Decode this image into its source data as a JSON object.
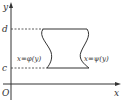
{
  "diagram": {
    "axes": {
      "x_label": "x",
      "y_label": "y",
      "origin_label": "O"
    },
    "levels": {
      "top_label": "d",
      "bottom_label": "c"
    },
    "curves": {
      "left_label": "x=φ(y)",
      "right_label": "x=ψ(y)"
    },
    "colors": {
      "stroke": "#333333",
      "background": "#ffffff"
    }
  }
}
